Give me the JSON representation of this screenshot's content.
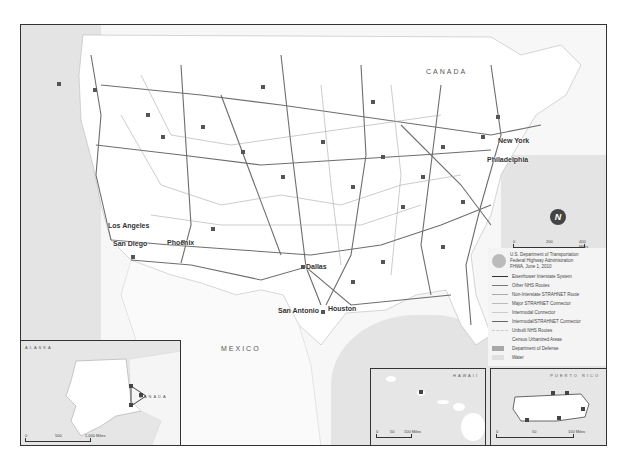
{
  "map": {
    "title_region": "Contiguous United States National Highway System",
    "country_labels": {
      "canada": "CANADA",
      "mexico": "MEXICO"
    },
    "cities": [
      {
        "name": "New York",
        "x": 497,
        "y": 138
      },
      {
        "name": "Philadelphia",
        "x": 486,
        "y": 156
      },
      {
        "name": "Los Angeles",
        "x": 107,
        "y": 222
      },
      {
        "name": "San Diego",
        "x": 114,
        "y": 240
      },
      {
        "name": "Phoenix",
        "x": 166,
        "y": 240
      },
      {
        "name": "Dallas",
        "x": 305,
        "y": 263
      },
      {
        "name": "San Antonio",
        "x": 277,
        "y": 306
      },
      {
        "name": "Houston",
        "x": 327,
        "y": 305
      }
    ],
    "scale": {
      "ticks": [
        "0",
        "200",
        "400 Miles"
      ]
    },
    "north_arrow": "N"
  },
  "legend": {
    "agency_lines": [
      "U.S. Department of Transportation",
      "Federal Highway Administration",
      "FHWA, June 1, 2010"
    ],
    "items": [
      {
        "label": "Eisenhower Interstate System",
        "type": "line",
        "color": "#333333",
        "width": 1.5
      },
      {
        "label": "Other NHS Routes",
        "type": "line",
        "color": "#777777",
        "width": 1
      },
      {
        "label": "Non-Interstate STRAHNET Route",
        "type": "line",
        "color": "#aaaaaa",
        "width": 1
      },
      {
        "label": "Major STRAHNET Connector",
        "type": "line",
        "color": "#bbbbbb",
        "width": 1
      },
      {
        "label": "Intermodal Connector",
        "type": "line",
        "color": "#cccccc",
        "width": 1
      },
      {
        "label": "Intermodal/STRAHNET Connector",
        "type": "line",
        "color": "#666666",
        "width": 1
      },
      {
        "label": "Unbuilt NHS Routes",
        "type": "line",
        "color": "#d8d8d8",
        "width": 1
      },
      {
        "label": "Census Urbanized Areas",
        "type": "none",
        "color": "#f4f4f4"
      },
      {
        "label": "Department of Defense",
        "type": "box",
        "color": "#a8a8a8"
      },
      {
        "label": "Water",
        "type": "box",
        "color": "#e0e0e0"
      }
    ]
  },
  "insets": {
    "alaska": {
      "title": "ALASKA",
      "country": "CANADA",
      "scale": [
        "0",
        "500",
        "1,000 Miles"
      ]
    },
    "hawaii": {
      "title": "HAWAII",
      "scale": [
        "0",
        "50",
        "100 Miles"
      ]
    },
    "puerto_rico": {
      "title": "PUERTO RICO",
      "scale": [
        "0",
        "50",
        "100 Miles"
      ]
    }
  }
}
